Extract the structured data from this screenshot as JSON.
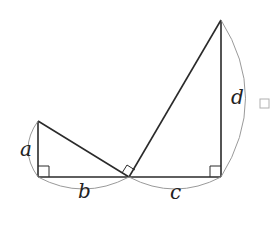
{
  "diagram": {
    "colors": {
      "line": "#2a2a2a",
      "arc": "#9a9a9a",
      "text": "#222222",
      "background": "#ffffff"
    },
    "labels": {
      "a": "a",
      "b": "b",
      "c": "c",
      "d": "d"
    },
    "answer_box": {
      "visible": true
    }
  }
}
